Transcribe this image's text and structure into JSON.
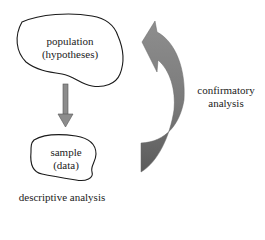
{
  "diagram": {
    "nodes": [
      {
        "id": "population",
        "line1": "population",
        "line2": "(hypotheses)"
      },
      {
        "id": "sample",
        "line1": "sample",
        "line2": "(data)"
      }
    ],
    "edges": [
      {
        "from": "population",
        "to": "sample",
        "style": "straight-down-arrow",
        "label": "descriptive analysis"
      },
      {
        "from": "sample",
        "to": "population",
        "style": "curved-up-arrow",
        "label_line1": "confirmatory",
        "label_line2": "analysis"
      }
    ],
    "colors": {
      "down_arrow": "#8c8c8c",
      "curved_arrow_top": "#8a8a8a",
      "curved_arrow_bottom": "#5e5e5e",
      "outline": "#1a1a1a"
    }
  }
}
